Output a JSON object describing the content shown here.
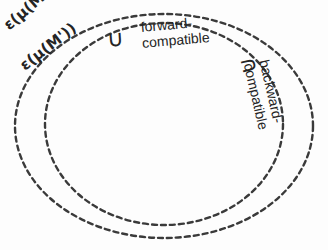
{
  "figure": {
    "type": "set-diagram",
    "background_color": "#fdfdfd",
    "stroke_color": "#3a3a3a",
    "text_color": "#242424",
    "shapes": [
      {
        "name": "outer-ellipse",
        "label": "ε(μ(M))",
        "cx": 164,
        "cy": 126,
        "rx": 149,
        "ry": 112,
        "style": "dashed"
      },
      {
        "name": "inner-ellipse",
        "label": "ε(μ(M'))",
        "cx": 164,
        "cy": 124,
        "rx": 119,
        "ry": 101,
        "style": "dashed"
      }
    ],
    "labels": {
      "outer_set": "ε(μ(M))",
      "inner_set": "ε(μ(M'))",
      "union_symbol": "∪",
      "forward_line1": "forward-",
      "forward_line2": "compatible",
      "intersect_symbol": "∩",
      "backward_line1": "backward-",
      "backward_line2": "compatible"
    },
    "bleed_through": {
      "line1": "              ",
      "line2": "            ",
      "line3": "          ",
      "line4": "            ",
      "line5": "           "
    }
  }
}
